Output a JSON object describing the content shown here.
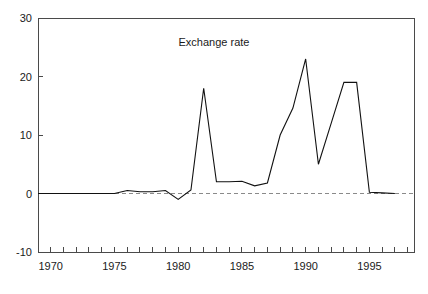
{
  "chart_data": {
    "type": "line",
    "title": "Exchange rate",
    "xlabel": "",
    "ylabel": "",
    "xlim": [
      1969,
      1998.5
    ],
    "ylim": [
      -10,
      30
    ],
    "grid": false,
    "legend": null,
    "zero_reference_line": 0,
    "x_tick_labels": [
      "1970",
      "1975",
      "1980",
      "1985",
      "1990",
      "1995"
    ],
    "x_tick_values": [
      1970,
      1975,
      1980,
      1985,
      1990,
      1995
    ],
    "x_minor_tick_values": [
      1969,
      1970,
      1971,
      1972,
      1973,
      1974,
      1975,
      1976,
      1977,
      1978,
      1979,
      1980,
      1981,
      1982,
      1983,
      1984,
      1985,
      1986,
      1987,
      1988,
      1989,
      1990,
      1991,
      1992,
      1993,
      1994,
      1995,
      1996,
      1997,
      1998
    ],
    "y_tick_labels": [
      "30",
      "20",
      "10",
      "0",
      "-10"
    ],
    "y_tick_values": [
      30,
      20,
      10,
      0,
      -10
    ],
    "series": [
      {
        "name": "Exchange rate",
        "color": "#111111",
        "x": [
          1969,
          1970,
          1971,
          1972,
          1973,
          1974,
          1975,
          1976,
          1977,
          1978,
          1979,
          1980,
          1981,
          1982,
          1983,
          1984,
          1985,
          1986,
          1987,
          1988,
          1989,
          1990,
          1991,
          1992,
          1993,
          1994,
          1995,
          1996,
          1997
        ],
        "values": [
          0.0,
          0.0,
          0.0,
          0.0,
          0.0,
          0.0,
          0.0,
          0.5,
          0.3,
          0.3,
          0.5,
          -1.0,
          0.6,
          18.0,
          2.0,
          2.0,
          2.1,
          1.3,
          1.8,
          10.0,
          14.6,
          23.0,
          5.0,
          12.0,
          19.0,
          19.0,
          0.2,
          0.1,
          0.0
        ]
      }
    ]
  }
}
